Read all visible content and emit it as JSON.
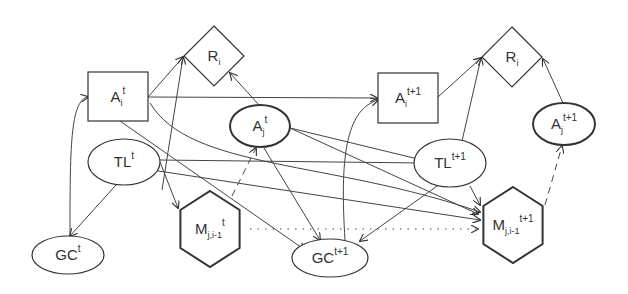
{
  "diagram": {
    "nodes": [
      {
        "id": "Ri_t",
        "shape": "diamond",
        "base": "R",
        "sub": "i",
        "sup": "",
        "cx": 214,
        "cy": 56,
        "r": 30,
        "stroke": 1.2
      },
      {
        "id": "Ai_t",
        "shape": "rect",
        "base": "A",
        "sub": "i",
        "sup": "t",
        "x": 88,
        "y": 72,
        "w": 60,
        "h": 49,
        "stroke": 1.2
      },
      {
        "id": "Aj_t",
        "shape": "ellipse",
        "base": "A",
        "sub": "j",
        "sup": "t",
        "cx": 260,
        "cy": 126,
        "rx": 30,
        "ry": 21,
        "stroke": 2
      },
      {
        "id": "TL_t",
        "shape": "ellipse",
        "base": "TL",
        "sub": "",
        "sup": "t",
        "cx": 124,
        "cy": 162,
        "rx": 36,
        "ry": 23,
        "stroke": 1.2
      },
      {
        "id": "GC_t",
        "shape": "ellipse",
        "base": "GC",
        "sub": "",
        "sup": "t",
        "cx": 68,
        "cy": 255,
        "rx": 36,
        "ry": 19,
        "stroke": 1.2
      },
      {
        "id": "M_t",
        "shape": "hexagon",
        "base": "M",
        "sub": "j,i-1",
        "sup": "t",
        "cx": 210,
        "cy": 229,
        "r": 38,
        "stroke": 2
      },
      {
        "id": "GC_t1",
        "shape": "ellipse",
        "base": "GC",
        "sub": "",
        "sup": "t+1",
        "cx": 330,
        "cy": 258,
        "rx": 38,
        "ry": 19,
        "stroke": 1.2
      },
      {
        "id": "Ai_t1",
        "shape": "rect",
        "base": "A",
        "sub": "i",
        "sup": "t+1",
        "x": 378,
        "y": 73,
        "w": 60,
        "h": 50,
        "stroke": 1.2
      },
      {
        "id": "Ri_t1",
        "shape": "diamond",
        "base": "R",
        "sub": "i",
        "sup": "",
        "cx": 512,
        "cy": 57,
        "r": 30,
        "stroke": 1.2
      },
      {
        "id": "Aj_t1",
        "shape": "ellipse",
        "base": "A",
        "sub": "j",
        "sup": "t+1",
        "cx": 564,
        "cy": 124,
        "rx": 31,
        "ry": 21,
        "stroke": 2
      },
      {
        "id": "TL_t1",
        "shape": "ellipse",
        "base": "TL",
        "sub": "",
        "sup": "t+1",
        "cx": 450,
        "cy": 163,
        "rx": 36,
        "ry": 24,
        "stroke": 1.2
      },
      {
        "id": "M_t1",
        "shape": "hexagon",
        "base": "M",
        "sub": "j,i-1",
        "sup": "t+1",
        "cx": 513,
        "cy": 225,
        "r": 38,
        "stroke": 2
      }
    ],
    "edges": [
      {
        "d": "M148,97 L183,57",
        "style": "solid",
        "w": 1,
        "arrow": true
      },
      {
        "d": "M162,190 L183,57",
        "style": "solid",
        "w": 1,
        "arrow": true
      },
      {
        "d": "M259,105 L230,73",
        "style": "solid",
        "w": 1,
        "arrow": true
      },
      {
        "d": "M148,97 L377,98",
        "style": "solid",
        "w": 1,
        "arrow": true
      },
      {
        "d": "M70,236 C70,150 70,100 88,97",
        "style": "solid",
        "w": 1,
        "arrow": true
      },
      {
        "d": "M116,185 L70,236",
        "style": "solid",
        "w": 1,
        "arrow": true
      },
      {
        "d": "M120,121 L305,250",
        "style": "solid",
        "w": 1,
        "arrow": true
      },
      {
        "d": "M160,162 L178,208",
        "style": "solid",
        "w": 1,
        "arrow": true
      },
      {
        "d": "M150,103 C190,170 330,160 480,212",
        "style": "solid",
        "w": 1,
        "arrow": true
      },
      {
        "d": "M160,160 L422,163",
        "style": "solid",
        "w": 2,
        "arrow": true
      },
      {
        "d": "M290,128 L422,160",
        "style": "solid",
        "w": 1.6,
        "arrow": true
      },
      {
        "d": "M290,128 L478,214",
        "style": "solid",
        "w": 1.6,
        "arrow": true
      },
      {
        "d": "M232,196 L256,148",
        "style": "dashed",
        "w": 1.3,
        "arrow": true
      },
      {
        "d": "M264,148 L320,240",
        "style": "solid",
        "w": 1,
        "arrow": true
      },
      {
        "d": "M152,170 L480,220",
        "style": "solid",
        "w": 1,
        "arrow": true
      },
      {
        "d": "M345,240 C340,160 345,110 378,100",
        "style": "solid",
        "w": 1,
        "arrow": true
      },
      {
        "d": "M438,97 L481,58",
        "style": "solid",
        "w": 1,
        "arrow": true
      },
      {
        "d": "M462,141 L481,58",
        "style": "solid",
        "w": 1,
        "arrow": true
      },
      {
        "d": "M563,103 L543,59",
        "style": "solid",
        "w": 1,
        "arrow": true
      },
      {
        "d": "M440,184 L360,241",
        "style": "solid",
        "w": 1,
        "arrow": true
      },
      {
        "d": "M470,186 L480,205",
        "style": "solid",
        "w": 1,
        "arrow": true
      },
      {
        "d": "M545,205 L562,146",
        "style": "dashed",
        "w": 1.3,
        "arrow": true
      },
      {
        "d": "M250,229 L478,229",
        "style": "dotted",
        "w": 1.4,
        "arrow": true
      }
    ]
  }
}
